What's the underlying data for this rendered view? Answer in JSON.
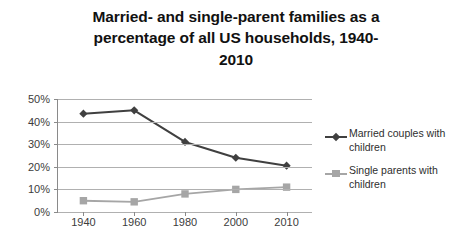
{
  "chart_data": {
    "type": "line",
    "title_lines": [
      "Married- and single-parent families as a",
      "percentage of all US households, 1940-",
      "2010"
    ],
    "categories": [
      "1940",
      "1960",
      "1980",
      "2000",
      "2010"
    ],
    "x": [
      1940,
      1960,
      1980,
      2000,
      2010
    ],
    "series": [
      {
        "name": "Married couples with children",
        "values": [
          43.5,
          45,
          31,
          24,
          20.5
        ],
        "color": "#404040",
        "marker": "diamond"
      },
      {
        "name": "Single parents with children",
        "values": [
          5,
          4.5,
          8,
          10,
          11
        ],
        "color": "#a6a6a6",
        "marker": "square"
      }
    ],
    "xlabel": "",
    "ylabel": "",
    "ylim": [
      0,
      50
    ],
    "ytick_values": [
      0,
      10,
      20,
      30,
      40,
      50
    ],
    "ytick_labels": [
      "0%",
      "10%",
      "20%",
      "30%",
      "40%",
      "50%"
    ],
    "grid": true,
    "grid_axis": "y",
    "grid_color": "#b0b0b0",
    "legend_position": "right",
    "background": "#ffffff"
  },
  "legend": {
    "entries": [
      {
        "label_line1": "Married couples with",
        "label_line2": "children"
      },
      {
        "label_line1": "Single parents with",
        "label_line2": "children"
      }
    ]
  }
}
